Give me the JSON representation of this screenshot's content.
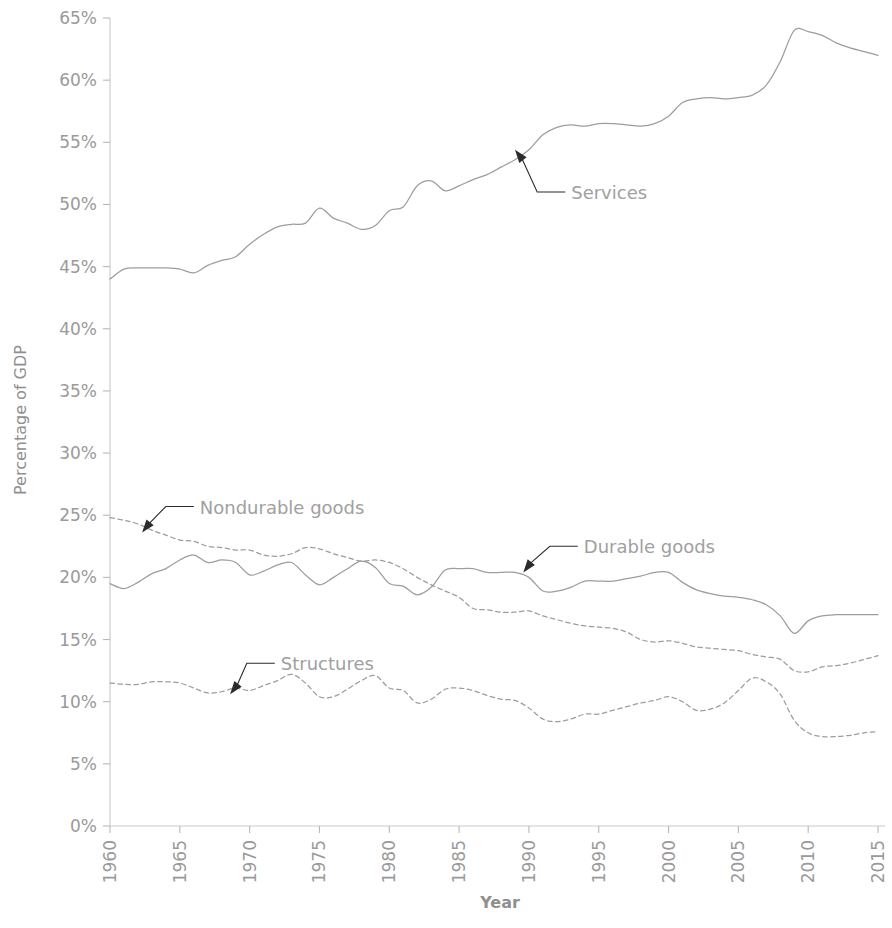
{
  "chart_data": {
    "type": "line",
    "title": "",
    "xlabel": "Year",
    "ylabel": "Percentage of GDP",
    "xlim": [
      1960,
      2015.5
    ],
    "ylim": [
      0,
      65
    ],
    "grid": false,
    "legend_position": "inline-annotations",
    "y_tick_labels": [
      "0%",
      "5%",
      "10%",
      "15%",
      "20%",
      "25%",
      "30%",
      "35%",
      "40%",
      "45%",
      "50%",
      "55%",
      "60%",
      "65%"
    ],
    "y_ticks": [
      0,
      5,
      10,
      15,
      20,
      25,
      30,
      35,
      40,
      45,
      50,
      55,
      60,
      65
    ],
    "x_tick_labels": [
      "1960",
      "1965",
      "1970",
      "1975",
      "1980",
      "1985",
      "1990",
      "1995",
      "2000",
      "2005",
      "2010",
      "2015"
    ],
    "x_ticks": [
      1960,
      1965,
      1970,
      1975,
      1980,
      1985,
      1990,
      1995,
      2000,
      2005,
      2010,
      2015
    ],
    "annotations": [
      {
        "label": "Services",
        "series": "Services",
        "point_x": 1989,
        "point_y": 54.4,
        "text_x": 1992.6,
        "text_y": 51.0
      },
      {
        "label": "Nondurable goods",
        "series": "Nondurable goods",
        "point_x": 1962.3,
        "point_y": 23.6,
        "text_x": 1966.0,
        "text_y": 25.7
      },
      {
        "label": "Durable goods",
        "series": "Durable goods",
        "point_x": 1989.6,
        "point_y": 20.4,
        "text_x": 1993.5,
        "text_y": 22.5
      },
      {
        "label": "Structures",
        "series": "Structures",
        "point_x": 1968.6,
        "point_y": 10.6,
        "text_x": 1971.8,
        "text_y": 13.1
      }
    ],
    "x": [
      1960,
      1961,
      1962,
      1963,
      1964,
      1965,
      1966,
      1967,
      1968,
      1969,
      1970,
      1971,
      1972,
      1973,
      1974,
      1975,
      1976,
      1977,
      1978,
      1979,
      1980,
      1981,
      1982,
      1983,
      1984,
      1985,
      1986,
      1987,
      1988,
      1989,
      1990,
      1991,
      1992,
      1993,
      1994,
      1995,
      1996,
      1997,
      1998,
      1999,
      2000,
      2001,
      2002,
      2003,
      2004,
      2005,
      2006,
      2007,
      2008,
      2009,
      2010,
      2011,
      2012,
      2013,
      2014,
      2015
    ],
    "series": [
      {
        "name": "Services",
        "style": "solid",
        "values": [
          44.0,
          44.8,
          44.9,
          44.9,
          44.9,
          44.8,
          44.5,
          45.1,
          45.5,
          45.8,
          46.8,
          47.6,
          48.2,
          48.4,
          48.5,
          49.7,
          48.9,
          48.5,
          48.0,
          48.3,
          49.5,
          49.8,
          51.5,
          51.9,
          51.1,
          51.5,
          52.0,
          52.4,
          53.0,
          53.6,
          54.4,
          55.6,
          56.2,
          56.4,
          56.3,
          56.5,
          56.5,
          56.4,
          56.3,
          56.5,
          57.1,
          58.2,
          58.5,
          58.6,
          58.5,
          58.6,
          58.8,
          59.6,
          61.5,
          64.0,
          63.9,
          63.6,
          63.0,
          62.6,
          62.3,
          62.0
        ]
      },
      {
        "name": "Nondurable goods",
        "style": "dotted",
        "values": [
          24.8,
          24.6,
          24.3,
          23.8,
          23.4,
          23.0,
          22.9,
          22.5,
          22.4,
          22.2,
          22.2,
          21.8,
          21.7,
          21.9,
          22.4,
          22.3,
          21.9,
          21.6,
          21.3,
          21.4,
          21.2,
          20.7,
          20.0,
          19.4,
          18.9,
          18.4,
          17.5,
          17.4,
          17.2,
          17.2,
          17.3,
          16.9,
          16.6,
          16.3,
          16.1,
          16.0,
          15.9,
          15.6,
          15.0,
          14.8,
          14.9,
          14.7,
          14.4,
          14.3,
          14.2,
          14.1,
          13.8,
          13.6,
          13.4,
          12.5,
          12.4,
          12.8,
          12.9,
          13.1,
          13.4,
          13.7
        ]
      },
      {
        "name": "Durable goods",
        "style": "solid",
        "values": [
          19.5,
          19.1,
          19.6,
          20.3,
          20.7,
          21.4,
          21.8,
          21.2,
          21.4,
          21.2,
          20.2,
          20.5,
          21.0,
          21.2,
          20.2,
          19.4,
          20.0,
          20.7,
          21.3,
          20.8,
          19.5,
          19.3,
          18.6,
          19.2,
          20.6,
          20.7,
          20.7,
          20.4,
          20.4,
          20.4,
          20.0,
          18.9,
          18.9,
          19.2,
          19.7,
          19.7,
          19.7,
          19.9,
          20.1,
          20.4,
          20.4,
          19.6,
          19.0,
          18.7,
          18.5,
          18.4,
          18.2,
          17.8,
          16.9,
          15.5,
          16.5,
          16.9,
          17.0,
          17.0,
          17.0,
          17.0
        ]
      },
      {
        "name": "Structures",
        "style": "dotted",
        "values": [
          11.5,
          11.4,
          11.4,
          11.6,
          11.6,
          11.5,
          11.1,
          10.7,
          10.8,
          11.1,
          10.9,
          11.3,
          11.7,
          12.2,
          11.5,
          10.4,
          10.4,
          11.0,
          11.7,
          12.1,
          11.1,
          10.9,
          9.9,
          10.2,
          11.0,
          11.1,
          10.9,
          10.5,
          10.2,
          10.1,
          9.5,
          8.6,
          8.4,
          8.6,
          9.0,
          9.0,
          9.3,
          9.6,
          9.9,
          10.1,
          10.4,
          10.0,
          9.3,
          9.4,
          9.9,
          10.9,
          11.9,
          11.6,
          10.6,
          8.5,
          7.5,
          7.2,
          7.2,
          7.3,
          7.5,
          7.6
        ]
      }
    ]
  }
}
